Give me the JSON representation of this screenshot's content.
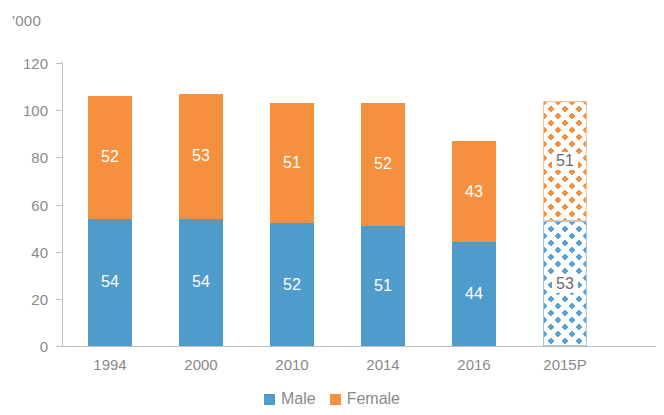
{
  "chart_data": {
    "type": "bar",
    "subtype": "stacked-vertical",
    "title": "",
    "xlabel": "",
    "ylabel": "",
    "unit_label": "'000",
    "categories": [
      "1994",
      "2000",
      "2010",
      "2014",
      "2016",
      "2015P"
    ],
    "series": [
      {
        "name": "Male",
        "color": "#4f9bcb",
        "values": [
          54,
          54,
          52,
          51,
          44,
          53
        ]
      },
      {
        "name": "Female",
        "color": "#f5903f",
        "values": [
          52,
          53,
          51,
          52,
          43,
          51
        ]
      }
    ],
    "totals": [
      106,
      107,
      103,
      103,
      87,
      104
    ],
    "ylim": [
      0,
      120
    ],
    "yticks": [
      0,
      20,
      40,
      60,
      80,
      100,
      120
    ],
    "ytick_labels": [
      "0",
      "20",
      "40",
      "60",
      "80",
      "100",
      "120"
    ],
    "grid": false,
    "legend_position": "bottom-center",
    "projected_category": "2015P",
    "projected_style": "diamond-pattern-fill",
    "data_labels": [
      {
        "category": "1994",
        "male": "54",
        "female": "52"
      },
      {
        "category": "2000",
        "male": "54",
        "female": "53"
      },
      {
        "category": "2010",
        "male": "52",
        "female": "51"
      },
      {
        "category": "2014",
        "male": "51",
        "female": "52"
      },
      {
        "category": "2016",
        "male": "44",
        "female": "43"
      },
      {
        "category": "2015P",
        "male": "53",
        "female": "51"
      }
    ]
  },
  "legend": {
    "items": [
      {
        "label": "Male",
        "color": "#4f9bcb"
      },
      {
        "label": "Female",
        "color": "#f5903f"
      }
    ]
  },
  "axis": {
    "unit": "'000"
  }
}
